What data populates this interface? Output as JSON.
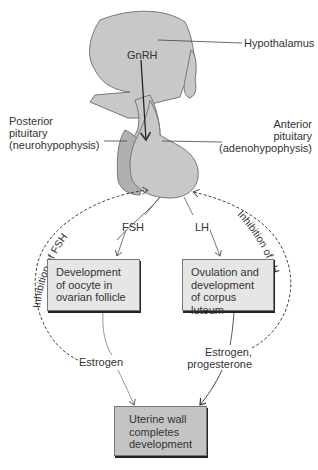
{
  "labels": {
    "gnrh": "GnRH",
    "hypothalamus": "Hypothalamus",
    "posterior": [
      "Posterior",
      "pituitary",
      "(neurohypophysis)"
    ],
    "anterior": [
      "Anterior",
      "pituitary",
      "(adenohypophysis)"
    ],
    "fsh": "FSH",
    "lh": "LH",
    "estrogen_left": "Estrogen",
    "estrogen_right": [
      "Estrogen,",
      "progesterone"
    ],
    "inhibition_fsh": "Inhibition of FSH",
    "inhibition_lh": "Inhibition of LH"
  },
  "boxes": {
    "oocyte": [
      "Development",
      "of oocyte in",
      "ovarian follicle"
    ],
    "ovulation": [
      "Ovulation and",
      "development",
      "of corpus luteum"
    ],
    "uterine": [
      "Uterine wall",
      "completes",
      "development"
    ]
  },
  "colors": {
    "organ_fill": "#c8c8c8",
    "posterior_fill": "#b0b0b0",
    "box_fill": "#e6e6e6",
    "final_box_fill": "#c4c4c4",
    "line": "#555555"
  }
}
